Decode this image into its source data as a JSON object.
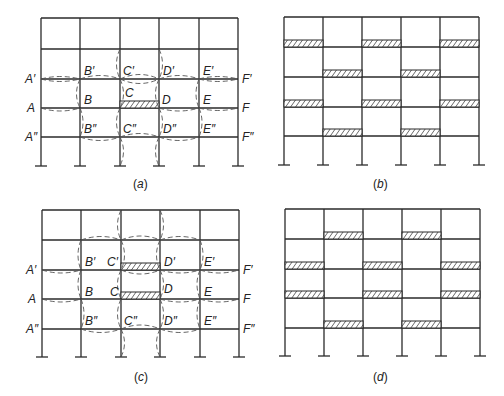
{
  "figure": {
    "panels": [
      {
        "id": "a",
        "caption": "(a)",
        "hinges": "single beam CD at level A",
        "node_labels": {
          "left": [
            "A'",
            "A",
            "A''"
          ],
          "right": [
            "F'",
            "F",
            "F''"
          ],
          "top_row": [
            "B'",
            "C'",
            "D'",
            "E'"
          ],
          "mid_row": [
            "B",
            "C",
            "D",
            "E"
          ],
          "bottom_row": [
            "B''",
            "C''",
            "D''",
            "E''"
          ]
        }
      },
      {
        "id": "b",
        "caption": "(b)",
        "hinges": "checkerboard pattern of loaded bays"
      },
      {
        "id": "c",
        "caption": "(c)",
        "hinges": "beams C'D' and CD",
        "node_labels": {
          "left": [
            "A'",
            "A",
            "A''"
          ],
          "right": [
            "F'",
            "F",
            "F''"
          ],
          "top_row": [
            "B'",
            "C'",
            "D'",
            "E'"
          ],
          "mid_row": [
            "B",
            "C",
            "D",
            "E"
          ],
          "bottom_row": [
            "B''",
            "C''",
            "D''",
            "E''"
          ]
        }
      },
      {
        "id": "d",
        "caption": "(d)",
        "hinges": "alternate checkerboard pattern of loaded bays"
      }
    ],
    "colors": {
      "line": "#2a2a2a",
      "dashed": "#555555",
      "background": "#ffffff"
    }
  }
}
